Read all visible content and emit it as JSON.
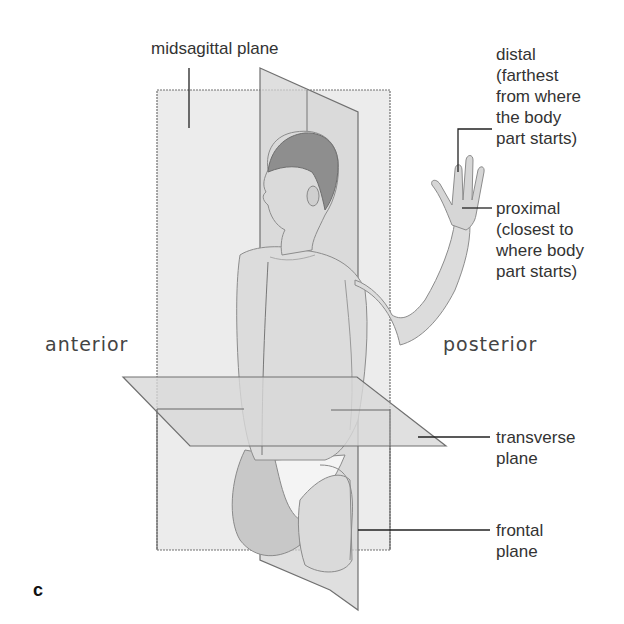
{
  "figure": {
    "panel_letter": "c",
    "direction_labels": {
      "anterior": "anterior",
      "posterior": "posterior"
    },
    "labels": {
      "midsagittal": "midsagittal plane",
      "distal": "distal\n(farthest\nfrom where\nthe body\npart starts)",
      "proximal": "proximal\n(closest to\nwhere body\npart starts)",
      "transverse": "transverse\nplane",
      "frontal": "frontal\nplane"
    },
    "colors": {
      "plane_fill": "#e6e6e6",
      "plane_edge": "#6e6e6e",
      "skin": "#d9d9d9",
      "hair": "#8a8a8a",
      "leader_line": "#222222",
      "text": "#333333"
    }
  }
}
